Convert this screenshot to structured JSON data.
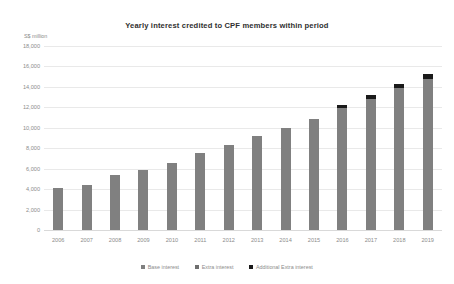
{
  "chart_data": {
    "type": "bar",
    "title": "Yearly interest credited to CPF members within period",
    "subtitle": "",
    "xlabel": "",
    "ylabel": "S$ million",
    "axis_unit_caption": "S$ million",
    "ylim": [
      0,
      18000
    ],
    "ytick_step": 2000,
    "grid": true,
    "legend_position": "bottom",
    "stacked": true,
    "categories": [
      "2006",
      "2007",
      "2008",
      "2009",
      "2010",
      "2011",
      "2012",
      "2013",
      "2014",
      "2015",
      "2016",
      "2017",
      "2018",
      "2019"
    ],
    "ytick_labels": [
      "18,000",
      "16,000",
      "14,000",
      "12,000",
      "10,000",
      "8,000",
      "6,000",
      "4,000",
      "2,000",
      "0"
    ],
    "ytick_values": [
      18000,
      16000,
      14000,
      12000,
      10000,
      8000,
      6000,
      4000,
      2000,
      0
    ],
    "series": [
      {
        "name": "Base interest",
        "color": "#808080",
        "values": [
          4100,
          4400,
          5400,
          5900,
          6600,
          7500,
          8300,
          9200,
          10000,
          10900,
          11900,
          12800,
          13900,
          14800
        ]
      },
      {
        "name": "Extra interest",
        "color": "#6f6f6f",
        "values": [
          0,
          0,
          0,
          0,
          0,
          0,
          0,
          0,
          0,
          0,
          0,
          0,
          0,
          0
        ]
      },
      {
        "name": "Additional Extra interest",
        "color": "#1a1a1a",
        "values": [
          0,
          0,
          0,
          0,
          0,
          0,
          0,
          0,
          0,
          0,
          300,
          400,
          400,
          500
        ]
      }
    ],
    "totals": [
      4100,
      4400,
      5400,
      5900,
      6600,
      7500,
      8300,
      9200,
      10000,
      10900,
      12200,
      13200,
      14300,
      15300
    ]
  },
  "legend": {
    "items": [
      {
        "label": "Base interest",
        "color": "#808080"
      },
      {
        "label": "Extra interest",
        "color": "#6f6f6f"
      },
      {
        "label": "Additional Extra interest",
        "color": "#1a1a1a"
      }
    ]
  }
}
